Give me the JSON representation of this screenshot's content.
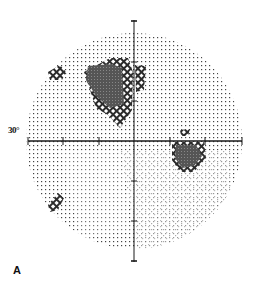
{
  "figure": {
    "type": "visual-field-grayscale",
    "panel_label": "A",
    "eccentricity_label": "30°",
    "center": [
      134,
      141
    ],
    "radius": 108,
    "axis_ticks_px": 35.5,
    "colors": {
      "ink": "#1a1a1a",
      "dot": "#333333",
      "dark": "#4a4a4a",
      "hatch": "#2b2b2b"
    }
  },
  "defects": [
    {
      "name": "superior-paracentral-scotoma",
      "shape": "dense",
      "points": [
        [
          88,
          66
        ],
        [
          112,
          64
        ],
        [
          122,
          68
        ],
        [
          124,
          104
        ],
        [
          110,
          108
        ],
        [
          96,
          96
        ],
        [
          86,
          80
        ]
      ]
    },
    {
      "name": "superior-paracentral-hatch",
      "shape": "hatch",
      "points": [
        [
          110,
          58
        ],
        [
          128,
          58
        ],
        [
          133,
          72
        ],
        [
          132,
          110
        ],
        [
          120,
          128
        ],
        [
          108,
          115
        ],
        [
          96,
          108
        ],
        [
          88,
          84
        ],
        [
          84,
          72
        ]
      ]
    },
    {
      "name": "nasal-edge-hatch",
      "shape": "hatch",
      "points": [
        [
          135,
          65
        ],
        [
          146,
          66
        ],
        [
          144,
          90
        ],
        [
          136,
          92
        ]
      ]
    },
    {
      "name": "blind-spot",
      "shape": "dense",
      "points": [
        [
          176,
          145
        ],
        [
          196,
          145
        ],
        [
          202,
          156
        ],
        [
          194,
          166
        ],
        [
          182,
          168
        ],
        [
          175,
          158
        ]
      ]
    },
    {
      "name": "blind-spot-hatch",
      "shape": "hatch",
      "points": [
        [
          172,
          142
        ],
        [
          204,
          142
        ],
        [
          206,
          158
        ],
        [
          194,
          172
        ],
        [
          180,
          172
        ],
        [
          172,
          160
        ]
      ]
    },
    {
      "name": "blind-spot-upper-fleck",
      "shape": "hatch",
      "points": [
        [
          180,
          130
        ],
        [
          190,
          129
        ],
        [
          188,
          136
        ],
        [
          181,
          136
        ]
      ]
    },
    {
      "name": "superotemporal-fleck",
      "shape": "hatch",
      "points": [
        [
          48,
          72
        ],
        [
          60,
          65
        ],
        [
          66,
          72
        ],
        [
          62,
          80
        ],
        [
          50,
          80
        ]
      ]
    },
    {
      "name": "inferotemporal-fleck",
      "shape": "hatch",
      "points": [
        [
          48,
          205
        ],
        [
          58,
          193
        ],
        [
          64,
          198
        ],
        [
          58,
          210
        ],
        [
          50,
          212
        ]
      ]
    }
  ]
}
